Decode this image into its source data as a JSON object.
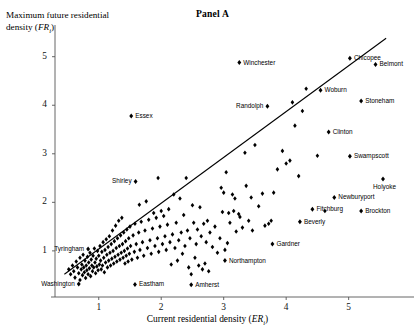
{
  "figure": {
    "panel_title": "Panel A",
    "ylabel_line1": "Maximum future residential",
    "ylabel_line2_pre": "density (",
    "ylabel_var": "FR",
    "ylabel_sub": "i",
    "ylabel_line2_post": ")",
    "xlabel_pre": "Current residential density (",
    "xlabel_var": "ER",
    "xlabel_sub": "i",
    "xlabel_post": ")"
  },
  "chart_data": {
    "type": "scatter",
    "title": "Panel A",
    "xlabel": "Current residential density (ER_i)",
    "ylabel": "Maximum future residential density (FR_i)",
    "xlim": [
      0.3,
      5.95
    ],
    "ylim": [
      0.05,
      5.55
    ],
    "xticks": [
      1,
      2,
      3,
      4,
      5
    ],
    "yticks": [
      1,
      2,
      3,
      4,
      5
    ],
    "grid": false,
    "legend": null,
    "marker": "diamond",
    "marker_color": "#000000",
    "reference_line": {
      "description": "45-degree-like regression/reference line",
      "x0": 0.45,
      "y0": 0.52,
      "x1": 5.6,
      "y1": 5.38,
      "color": "#000000"
    },
    "labeled_points": [
      {
        "name": "Winchester",
        "x": 3.25,
        "y": 4.88,
        "anchor": "left"
      },
      {
        "name": "Chicopee",
        "x": 5.02,
        "y": 4.97,
        "anchor": "left"
      },
      {
        "name": "Belmont",
        "x": 5.43,
        "y": 4.84,
        "anchor": "left"
      },
      {
        "name": "Woburn",
        "x": 4.55,
        "y": 4.31,
        "anchor": "left"
      },
      {
        "name": "Randolph",
        "x": 3.7,
        "y": 3.98,
        "anchor": "right"
      },
      {
        "name": "Stoneham",
        "x": 5.2,
        "y": 4.09,
        "anchor": "left"
      },
      {
        "name": "Essex",
        "x": 1.52,
        "y": 3.78,
        "anchor": "left"
      },
      {
        "name": "Clinton",
        "x": 4.68,
        "y": 3.45,
        "anchor": "left"
      },
      {
        "name": "Swampscott",
        "x": 5.02,
        "y": 2.95,
        "anchor": "left"
      },
      {
        "name": "Shirley",
        "x": 1.59,
        "y": 2.43,
        "anchor": "right"
      },
      {
        "name": "Holyoke",
        "x": 5.55,
        "y": 2.48,
        "anchor": "below"
      },
      {
        "name": "Newburyport",
        "x": 4.77,
        "y": 2.1,
        "anchor": "left"
      },
      {
        "name": "Fitchburg",
        "x": 4.42,
        "y": 1.86,
        "anchor": "left"
      },
      {
        "name": "Brockton",
        "x": 5.2,
        "y": 1.82,
        "anchor": "left"
      },
      {
        "name": "Beverly",
        "x": 4.22,
        "y": 1.6,
        "anchor": "left"
      },
      {
        "name": "Gardner",
        "x": 3.78,
        "y": 1.14,
        "anchor": "left"
      },
      {
        "name": "Tyringham",
        "x": 0.83,
        "y": 1.04,
        "anchor": "right"
      },
      {
        "name": "Northampton",
        "x": 3.02,
        "y": 0.8,
        "anchor": "left"
      },
      {
        "name": "Washington",
        "x": 0.68,
        "y": 0.32,
        "anchor": "right"
      },
      {
        "name": "Eastham",
        "x": 1.58,
        "y": 0.31,
        "anchor": "left"
      },
      {
        "name": "Amherst",
        "x": 2.48,
        "y": 0.3,
        "anchor": "left"
      }
    ],
    "unlabeled_points": [
      [
        0.52,
        0.62
      ],
      [
        0.55,
        0.52
      ],
      [
        0.58,
        0.7
      ],
      [
        0.6,
        0.58
      ],
      [
        0.62,
        0.45
      ],
      [
        0.64,
        0.78
      ],
      [
        0.66,
        0.66
      ],
      [
        0.68,
        0.54
      ],
      [
        0.7,
        0.86
      ],
      [
        0.7,
        0.4
      ],
      [
        0.72,
        0.62
      ],
      [
        0.73,
        0.72
      ],
      [
        0.74,
        0.5
      ],
      [
        0.75,
        0.92
      ],
      [
        0.76,
        0.66
      ],
      [
        0.77,
        0.56
      ],
      [
        0.78,
        0.8
      ],
      [
        0.79,
        0.44
      ],
      [
        0.8,
        0.7
      ],
      [
        0.81,
        0.6
      ],
      [
        0.82,
        0.88
      ],
      [
        0.83,
        0.52
      ],
      [
        0.84,
        0.76
      ],
      [
        0.85,
        0.64
      ],
      [
        0.86,
        0.96
      ],
      [
        0.87,
        0.48
      ],
      [
        0.88,
        0.82
      ],
      [
        0.89,
        0.7
      ],
      [
        0.9,
        0.58
      ],
      [
        0.91,
        0.9
      ],
      [
        0.92,
        0.66
      ],
      [
        0.93,
        1.05
      ],
      [
        0.94,
        0.76
      ],
      [
        0.95,
        0.54
      ],
      [
        0.96,
        0.84
      ],
      [
        0.97,
        0.68
      ],
      [
        0.98,
        1.0
      ],
      [
        0.99,
        0.6
      ],
      [
        1.0,
        0.9
      ],
      [
        1.01,
        0.72
      ],
      [
        1.02,
        1.1
      ],
      [
        1.03,
        0.8
      ],
      [
        1.04,
        0.62
      ],
      [
        1.05,
        0.98
      ],
      [
        1.06,
        0.7
      ],
      [
        1.07,
        1.18
      ],
      [
        1.08,
        0.86
      ],
      [
        1.09,
        0.56
      ],
      [
        1.1,
        1.02
      ],
      [
        1.11,
        0.76
      ],
      [
        1.12,
        1.24
      ],
      [
        1.13,
        0.92
      ],
      [
        1.14,
        0.66
      ],
      [
        1.15,
        1.08
      ],
      [
        1.16,
        0.8
      ],
      [
        1.17,
        1.3
      ],
      [
        1.18,
        0.96
      ],
      [
        1.19,
        0.7
      ],
      [
        1.2,
        1.14
      ],
      [
        1.21,
        0.84
      ],
      [
        1.22,
        1.42
      ],
      [
        1.23,
        1.0
      ],
      [
        1.24,
        0.74
      ],
      [
        1.25,
        1.2
      ],
      [
        1.26,
        0.88
      ],
      [
        1.27,
        1.52
      ],
      [
        1.28,
        1.06
      ],
      [
        1.29,
        0.78
      ],
      [
        1.3,
        1.26
      ],
      [
        1.31,
        0.92
      ],
      [
        1.32,
        1.62
      ],
      [
        1.33,
        1.1
      ],
      [
        1.34,
        0.82
      ],
      [
        1.35,
        1.32
      ],
      [
        1.36,
        0.96
      ],
      [
        1.37,
        1.68
      ],
      [
        1.38,
        1.14
      ],
      [
        1.39,
        0.86
      ],
      [
        1.4,
        1.38
      ],
      [
        1.41,
        1.0
      ],
      [
        1.42,
        0.74
      ],
      [
        1.43,
        1.2
      ],
      [
        1.44,
        0.9
      ],
      [
        1.45,
        1.44
      ],
      [
        1.46,
        1.05
      ],
      [
        1.47,
        0.78
      ],
      [
        1.48,
        1.26
      ],
      [
        1.49,
        0.94
      ],
      [
        1.5,
        1.5
      ],
      [
        1.51,
        1.1
      ],
      [
        1.53,
        0.82
      ],
      [
        1.55,
        1.32
      ],
      [
        1.57,
        0.98
      ],
      [
        1.58,
        1.56
      ],
      [
        1.6,
        1.14
      ],
      [
        1.62,
        0.86
      ],
      [
        1.64,
        1.38
      ],
      [
        1.65,
        1.95
      ],
      [
        1.66,
        1.02
      ],
      [
        1.68,
        1.6
      ],
      [
        1.7,
        1.18
      ],
      [
        1.72,
        0.9
      ],
      [
        1.74,
        1.42
      ],
      [
        1.76,
        2.02
      ],
      [
        1.78,
        1.06
      ],
      [
        1.8,
        1.64
      ],
      [
        1.82,
        1.22
      ],
      [
        1.84,
        0.94
      ],
      [
        1.86,
        1.46
      ],
      [
        1.88,
        1.78
      ],
      [
        1.9,
        1.1
      ],
      [
        1.92,
        1.68
      ],
      [
        1.94,
        1.26
      ],
      [
        1.95,
        2.5
      ],
      [
        1.96,
        0.98
      ],
      [
        1.98,
        1.5
      ],
      [
        2.0,
        1.82
      ],
      [
        2.02,
        1.14
      ],
      [
        2.04,
        1.72
      ],
      [
        2.06,
        1.3
      ],
      [
        2.08,
        1.02
      ],
      [
        2.1,
        1.54
      ],
      [
        2.12,
        1.86
      ],
      [
        2.14,
        1.18
      ],
      [
        2.16,
        0.72
      ],
      [
        2.18,
        1.34
      ],
      [
        2.2,
        2.16
      ],
      [
        2.22,
        1.06
      ],
      [
        2.24,
        1.58
      ],
      [
        2.26,
        0.8
      ],
      [
        2.28,
        1.22
      ],
      [
        2.3,
        2.08
      ],
      [
        2.32,
        1.38
      ],
      [
        2.34,
        0.94
      ],
      [
        2.36,
        1.74
      ],
      [
        2.38,
        1.1
      ],
      [
        2.4,
        2.5
      ],
      [
        2.42,
        1.42
      ],
      [
        2.44,
        0.66
      ],
      [
        2.46,
        1.26
      ],
      [
        2.48,
        0.52
      ],
      [
        2.5,
        1.94
      ],
      [
        2.52,
        1.58
      ],
      [
        2.54,
        0.86
      ],
      [
        2.56,
        1.14
      ],
      [
        2.58,
        1.44
      ],
      [
        2.6,
        0.7
      ],
      [
        2.62,
        1.9
      ],
      [
        2.64,
        1.3
      ],
      [
        2.66,
        0.62
      ],
      [
        2.68,
        1.56
      ],
      [
        2.7,
        0.74
      ],
      [
        2.72,
        1.18
      ],
      [
        2.74,
        1.62
      ],
      [
        2.76,
        0.58
      ],
      [
        2.78,
        1.38
      ],
      [
        2.82,
        1.08
      ],
      [
        2.86,
        1.5
      ],
      [
        2.9,
        0.96
      ],
      [
        2.94,
        1.26
      ],
      [
        2.96,
        2.3
      ],
      [
        2.98,
        1.8
      ],
      [
        3.0,
        2.2
      ],
      [
        3.02,
        1.02
      ],
      [
        3.04,
        2.62
      ],
      [
        3.06,
        1.16
      ],
      [
        3.08,
        1.78
      ],
      [
        3.1,
        1.58
      ],
      [
        3.14,
        2.16
      ],
      [
        3.16,
        1.82
      ],
      [
        3.18,
        2.08
      ],
      [
        3.2,
        1.4
      ],
      [
        3.24,
        1.76
      ],
      [
        3.26,
        1.7
      ],
      [
        3.3,
        1.48
      ],
      [
        3.34,
        3.02
      ],
      [
        3.36,
        2.34
      ],
      [
        3.4,
        1.62
      ],
      [
        3.44,
        2.1
      ],
      [
        3.46,
        1.42
      ],
      [
        3.5,
        3.18
      ],
      [
        3.56,
        1.92
      ],
      [
        3.62,
        2.18
      ],
      [
        3.66,
        1.52
      ],
      [
        3.72,
        1.56
      ],
      [
        3.76,
        1.62
      ],
      [
        3.8,
        2.2
      ],
      [
        3.86,
        2.68
      ],
      [
        3.94,
        3.06
      ],
      [
        4.0,
        2.8
      ],
      [
        4.06,
        2.86
      ],
      [
        4.1,
        4.06
      ],
      [
        4.14,
        3.58
      ],
      [
        4.2,
        2.54
      ],
      [
        4.26,
        3.88
      ],
      [
        4.32,
        4.34
      ],
      [
        4.5,
        2.96
      ],
      [
        4.62,
        1.82
      ]
    ]
  }
}
